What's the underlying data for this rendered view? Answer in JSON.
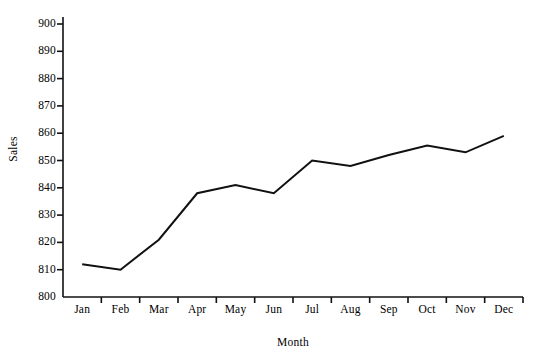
{
  "chart_data": {
    "type": "line",
    "title": "",
    "xlabel": "Month",
    "ylabel": "Sales",
    "categories": [
      "Jan",
      "Feb",
      "Mar",
      "Apr",
      "May",
      "Jun",
      "Jul",
      "Aug",
      "Sep",
      "Oct",
      "Nov",
      "Dec"
    ],
    "values": [
      812,
      810,
      821,
      838,
      841,
      838,
      850,
      848,
      852,
      855.5,
      853,
      859
    ],
    "series": [
      {
        "name": "Sales",
        "values": [
          812,
          810,
          821,
          838,
          841,
          838,
          850,
          848,
          852,
          855.5,
          853,
          859
        ]
      }
    ],
    "ylim": [
      800,
      900
    ],
    "yticks": [
      800,
      810,
      820,
      830,
      840,
      850,
      860,
      870,
      880,
      890,
      900
    ],
    "ytick_labels": [
      "800",
      "810",
      "820",
      "830",
      "840",
      "850",
      "860",
      "870",
      "880",
      "890",
      "900"
    ],
    "grid": false,
    "legend": false,
    "legend_position": "none",
    "line_color": "#111111",
    "line_width": 2,
    "markers": false,
    "background_color": "#ffffff",
    "axis_color": "#111111",
    "text_color": "#000000",
    "spines": [
      "left",
      "bottom"
    ],
    "tick_placement": "interval-edges"
  }
}
